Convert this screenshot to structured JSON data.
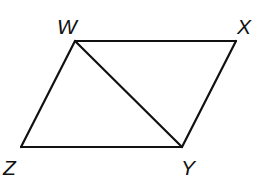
{
  "diagram": {
    "type": "parallelogram-with-diagonal",
    "stroke_color": "#111111",
    "background": "#ffffff",
    "vertices": {
      "W": {
        "label": "W",
        "x": 75,
        "y": 41,
        "label_x": 57,
        "label_y": 34
      },
      "X": {
        "label": "X",
        "x": 236,
        "y": 41,
        "label_x": 237,
        "label_y": 34
      },
      "Y": {
        "label": "Y",
        "x": 182,
        "y": 147,
        "label_x": 181,
        "label_y": 175
      },
      "Z": {
        "label": "Z",
        "x": 21,
        "y": 147,
        "label_x": 3,
        "label_y": 175
      }
    },
    "edges": [
      {
        "from": "W",
        "to": "X"
      },
      {
        "from": "X",
        "to": "Y"
      },
      {
        "from": "Y",
        "to": "Z"
      },
      {
        "from": "Z",
        "to": "W"
      },
      {
        "from": "W",
        "to": "Y",
        "kind": "diagonal"
      }
    ]
  }
}
